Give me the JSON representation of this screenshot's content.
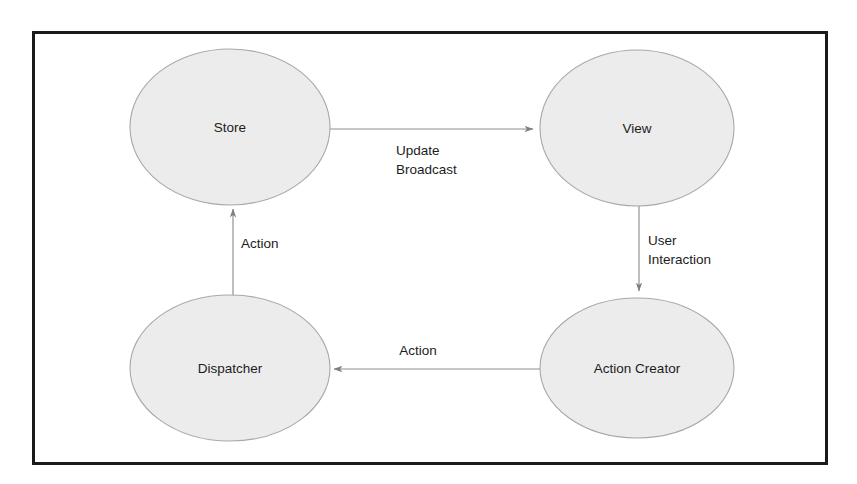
{
  "diagram": {
    "background_color": "#ffffff",
    "border_color": "#1a1a1a",
    "node_fill_color": "#ececec",
    "node_stroke_color": "#a8a8a8",
    "edge_color": "#8d8d8d",
    "text_color": "#1c1c1c",
    "nodes": [
      {
        "id": "store",
        "label": "Store",
        "shape": "ellipse",
        "cx": 230,
        "cy": 127,
        "rx": 100,
        "ry": 78
      },
      {
        "id": "view",
        "label": "View",
        "shape": "ellipse",
        "cx": 637,
        "cy": 128,
        "rx": 97,
        "ry": 78
      },
      {
        "id": "dispatcher",
        "label": "Dispatcher",
        "shape": "ellipse",
        "cx": 230,
        "cy": 368,
        "rx": 100,
        "ry": 73
      },
      {
        "id": "action-creator",
        "label": "Action Creator",
        "shape": "ellipse",
        "cx": 637,
        "cy": 368,
        "rx": 97,
        "ry": 70
      }
    ],
    "edges": [
      {
        "id": "store-to-view",
        "from": "store",
        "to": "view",
        "label": "Update Broadcast",
        "label_lines": [
          "Update",
          "Broadcast"
        ],
        "direction": "right"
      },
      {
        "id": "view-to-action-creator",
        "from": "view",
        "to": "action-creator",
        "label": "User Interaction",
        "label_lines": [
          "User",
          "Interaction"
        ],
        "direction": "down"
      },
      {
        "id": "action-creator-to-dispatcher",
        "from": "action-creator",
        "to": "dispatcher",
        "label": "Action",
        "label_lines": [
          "Action"
        ],
        "direction": "left"
      },
      {
        "id": "dispatcher-to-store",
        "from": "dispatcher",
        "to": "store",
        "label": "Action",
        "label_lines": [
          "Action"
        ],
        "direction": "up"
      }
    ]
  }
}
